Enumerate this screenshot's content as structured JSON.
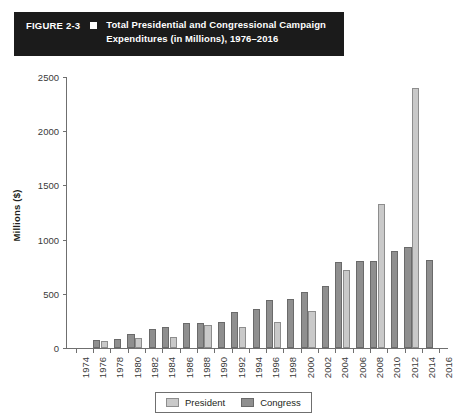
{
  "title": {
    "figure_label": "FIGURE 2-3",
    "marker": "square-bullet",
    "line1": "Total Presidential and Congressional Campaign",
    "line2": "Expenditures (in Millions), 1976–2016"
  },
  "legend": {
    "president_label": "President",
    "congress_label": "Congress"
  },
  "colors": {
    "president": "#c9c9c9",
    "congress": "#8f8f8f",
    "banner_background": "#1b1b1b",
    "banner_text": "#ffffff",
    "axis": "#6f6f6f"
  },
  "chart_data": {
    "type": "bar",
    "title": "Total Presidential and Congressional Campaign Expenditures (in Millions), 1976–2016",
    "xlabel": "",
    "ylabel": "Millions ($)",
    "ylim": [
      0,
      2500
    ],
    "yticks": [
      0,
      500,
      1000,
      1500,
      2000,
      2500
    ],
    "xticks": [
      1974,
      1976,
      1978,
      1980,
      1982,
      1984,
      1986,
      1988,
      1990,
      1992,
      1994,
      1996,
      1998,
      2000,
      2002,
      2004,
      2006,
      2008,
      2010,
      2012,
      2014,
      2016
    ],
    "grid": false,
    "legend_position": "bottom",
    "categories": [
      1976,
      1978,
      1980,
      1982,
      1984,
      1986,
      1988,
      1990,
      1992,
      1994,
      1996,
      1998,
      2000,
      2002,
      2004,
      2006,
      2008,
      2010,
      2012,
      2014
    ],
    "series": [
      {
        "name": "President",
        "values": [
          67,
          null,
          92,
          null,
          103,
          null,
          210,
          null,
          192,
          null,
          240,
          null,
          343,
          null,
          718,
          null,
          1324,
          null,
          2400,
          null
        ]
      },
      {
        "name": "Congress",
        "values": [
          73,
          85,
          125,
          175,
          191,
          228,
          230,
          239,
          333,
          357,
          440,
          455,
          516,
          572,
          790,
          805,
          800,
          895,
          930,
          815
        ]
      }
    ]
  }
}
